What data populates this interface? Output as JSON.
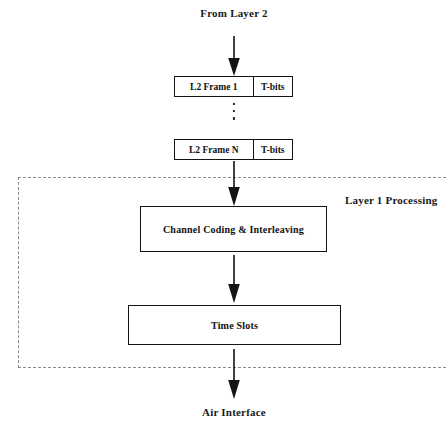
{
  "diagram": {
    "title_top": "From Layer 2",
    "title_bottom": "Air Interface",
    "region_label": "Layer 1 Processing",
    "frames": [
      {
        "name": "L2 Frame 1",
        "tail": "T-bits"
      },
      {
        "name": "L2 Frame N",
        "tail": "T-bits"
      }
    ],
    "ellipsis": "⋮",
    "blocks": [
      {
        "label": "Channel Coding & Interleaving"
      },
      {
        "label": "Time Slots"
      }
    ],
    "colors": {
      "background": "#ffffff",
      "stroke": "#141414",
      "text": "#111111",
      "dashed_boundary": "#8a8a8a"
    }
  }
}
